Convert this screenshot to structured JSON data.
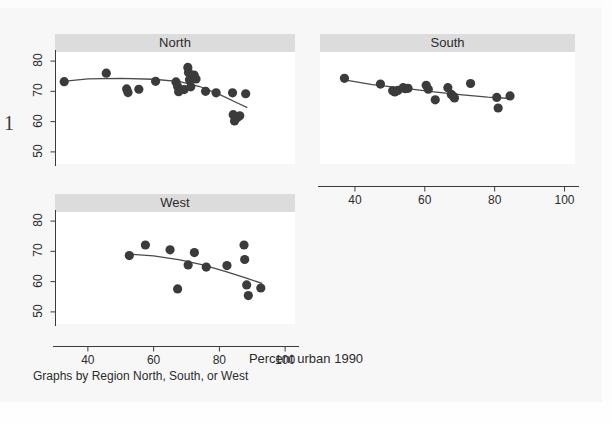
{
  "figure": {
    "xtitle": "Percent urban 1990",
    "note": "Graphs by Region North, South, or West",
    "margin_number": "1",
    "background_color": "#f7f7f7",
    "title_band_color": "#dcdcdc",
    "marker_color": "#3b3b3b",
    "line_color": "#4a4a4a"
  },
  "chart_data": {
    "type": "scatter",
    "title": "",
    "subtitle": "",
    "xlabel": "Percent urban 1990",
    "ylabel": "",
    "note": "Graphs by Region North, South, or West",
    "grid": false,
    "legend": "none",
    "facet_by": "Region North, South, or West",
    "xlim": [
      30,
      103
    ],
    "ylim": [
      46,
      83
    ],
    "xticks": [
      40,
      60,
      80,
      100
    ],
    "yticks": [
      50,
      60,
      70,
      80
    ],
    "xtick_labels": [
      "40",
      "60",
      "80",
      "100"
    ],
    "ytick_labels": [
      "50",
      "60",
      "70",
      "80"
    ],
    "panels": [
      {
        "name": "North",
        "show_xaxis": false,
        "show_yaxis": true,
        "points": [
          {
            "x": 32.8,
            "y": 73.2
          },
          {
            "x": 45.6,
            "y": 76.0
          },
          {
            "x": 51.8,
            "y": 70.8
          },
          {
            "x": 52.2,
            "y": 69.6
          },
          {
            "x": 55.5,
            "y": 70.7
          },
          {
            "x": 60.6,
            "y": 73.3
          },
          {
            "x": 66.8,
            "y": 73.1
          },
          {
            "x": 67.3,
            "y": 71.6
          },
          {
            "x": 67.6,
            "y": 69.9
          },
          {
            "x": 69.3,
            "y": 70.6
          },
          {
            "x": 70.4,
            "y": 77.9
          },
          {
            "x": 70.6,
            "y": 76.2
          },
          {
            "x": 70.9,
            "y": 73.8
          },
          {
            "x": 71.3,
            "y": 71.5
          },
          {
            "x": 72.3,
            "y": 75.4
          },
          {
            "x": 72.9,
            "y": 74.1
          },
          {
            "x": 75.8,
            "y": 70.0
          },
          {
            "x": 79.0,
            "y": 69.5
          },
          {
            "x": 84.0,
            "y": 69.5
          },
          {
            "x": 84.2,
            "y": 62.3
          },
          {
            "x": 84.6,
            "y": 60.2
          },
          {
            "x": 85.4,
            "y": 61.3
          },
          {
            "x": 86.2,
            "y": 61.9
          },
          {
            "x": 88.0,
            "y": 69.2
          }
        ],
        "fit_line": [
          {
            "x": 32.5,
            "y": 73.3
          },
          {
            "x": 40.0,
            "y": 74.1
          },
          {
            "x": 50.0,
            "y": 74.3
          },
          {
            "x": 60.0,
            "y": 74.0
          },
          {
            "x": 68.0,
            "y": 73.2
          },
          {
            "x": 74.0,
            "y": 71.6
          },
          {
            "x": 80.0,
            "y": 69.0
          },
          {
            "x": 85.0,
            "y": 66.4
          },
          {
            "x": 88.5,
            "y": 64.6
          }
        ]
      },
      {
        "name": "South",
        "show_xaxis": true,
        "show_yaxis": false,
        "points": [
          {
            "x": 37.0,
            "y": 74.3
          },
          {
            "x": 47.3,
            "y": 72.4
          },
          {
            "x": 50.8,
            "y": 70.2
          },
          {
            "x": 51.4,
            "y": 69.8
          },
          {
            "x": 52.3,
            "y": 70.3
          },
          {
            "x": 53.8,
            "y": 71.2
          },
          {
            "x": 54.4,
            "y": 70.9
          },
          {
            "x": 55.2,
            "y": 71.0
          },
          {
            "x": 60.4,
            "y": 72.0
          },
          {
            "x": 61.0,
            "y": 70.7
          },
          {
            "x": 63.0,
            "y": 67.2
          },
          {
            "x": 66.6,
            "y": 71.2
          },
          {
            "x": 67.6,
            "y": 69.0
          },
          {
            "x": 68.2,
            "y": 68.3
          },
          {
            "x": 68.5,
            "y": 67.8
          },
          {
            "x": 73.1,
            "y": 72.6
          },
          {
            "x": 80.6,
            "y": 68.0
          },
          {
            "x": 81.0,
            "y": 64.5
          },
          {
            "x": 84.4,
            "y": 68.5
          }
        ],
        "fit_line": [
          {
            "x": 37.0,
            "y": 73.8
          },
          {
            "x": 45.0,
            "y": 72.2
          },
          {
            "x": 55.0,
            "y": 70.9
          },
          {
            "x": 62.0,
            "y": 69.9
          },
          {
            "x": 70.0,
            "y": 68.9
          },
          {
            "x": 78.0,
            "y": 68.1
          },
          {
            "x": 85.0,
            "y": 67.6
          }
        ]
      },
      {
        "name": "West",
        "show_xaxis": true,
        "show_yaxis": true,
        "points": [
          {
            "x": 52.6,
            "y": 68.6
          },
          {
            "x": 57.5,
            "y": 72.1
          },
          {
            "x": 65.0,
            "y": 70.5
          },
          {
            "x": 67.3,
            "y": 57.6
          },
          {
            "x": 70.5,
            "y": 65.5
          },
          {
            "x": 72.4,
            "y": 69.6
          },
          {
            "x": 76.0,
            "y": 64.8
          },
          {
            "x": 82.3,
            "y": 65.3
          },
          {
            "x": 87.5,
            "y": 72.1
          },
          {
            "x": 87.7,
            "y": 67.3
          },
          {
            "x": 88.3,
            "y": 58.9
          },
          {
            "x": 88.8,
            "y": 55.4
          },
          {
            "x": 92.6,
            "y": 57.9
          }
        ],
        "fit_line": [
          {
            "x": 52.5,
            "y": 69.1
          },
          {
            "x": 60.0,
            "y": 68.5
          },
          {
            "x": 68.0,
            "y": 67.2
          },
          {
            "x": 75.0,
            "y": 65.5
          },
          {
            "x": 82.0,
            "y": 63.3
          },
          {
            "x": 88.0,
            "y": 61.2
          },
          {
            "x": 93.0,
            "y": 59.4
          }
        ]
      }
    ]
  }
}
